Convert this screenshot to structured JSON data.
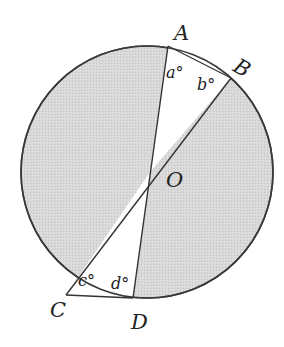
{
  "diagram": {
    "type": "circle-geometry",
    "colors": {
      "shaded": "#d6d6d6",
      "stroke": "#333333",
      "background": "#ffffff"
    },
    "points": {
      "A": {
        "label": "A"
      },
      "B": {
        "label": "B"
      },
      "C": {
        "label": "C"
      },
      "D": {
        "label": "D"
      },
      "O": {
        "label": "O"
      }
    },
    "angles": {
      "a": {
        "label": "a°",
        "at": "A"
      },
      "b": {
        "label": "b°",
        "at": "B"
      },
      "c": {
        "label": "c°",
        "at": "C"
      },
      "d": {
        "label": "d°",
        "at": "D"
      }
    },
    "segments": [
      "AD",
      "BC",
      "AB",
      "CD"
    ]
  }
}
